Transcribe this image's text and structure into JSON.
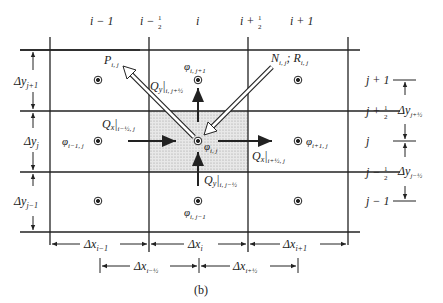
{
  "figure": {
    "caption": "(b)",
    "column_labels": [
      "i − 1",
      "i − ½",
      "i",
      "i + ½",
      "i + 1"
    ],
    "row_labels_right": [
      "j + 1",
      "j + ½",
      "j",
      "j − ½",
      "j − 1"
    ],
    "left_dims": [
      "Δy",
      "j+1",
      "Δy",
      "j",
      "Δy",
      "j−1"
    ],
    "right_dims": [
      "Δy",
      "j+½",
      "Δy",
      "j−½"
    ],
    "bottom_dims": [
      "Δx",
      "i−1",
      "Δx",
      "i",
      "Δx",
      "i+1"
    ],
    "bottom_half_dims": [
      "Δx",
      "i−½",
      "Δx",
      "i+½"
    ],
    "node_labels": {
      "center": "φ",
      "center_sub": "i, j",
      "north": "φ",
      "north_sub": "i, j+1",
      "south": "φ",
      "south_sub": "i, j−1",
      "west": "φ",
      "west_sub": "i−1, j",
      "east": "φ",
      "east_sub": "i+1, j"
    },
    "flux_labels": {
      "qx_west": "Q",
      "qx_west_sub": "x",
      "qx_west_at": "i−½, j",
      "qx_east": "Q",
      "qx_east_sub": "x",
      "qx_east_at": "i+½, j",
      "qy_north": "Q",
      "qy_north_sub": "y",
      "qy_north_at": "i, j+½",
      "qy_south": "Q",
      "qy_south_sub": "y",
      "qy_south_at": "i, j−½"
    },
    "source_labels": {
      "pumping": "P",
      "pumping_sub": "i, j",
      "recharge": "N",
      "recharge_sub": "i, j",
      "sep": "; ",
      "r": "R",
      "r_sub": "i, j"
    }
  }
}
